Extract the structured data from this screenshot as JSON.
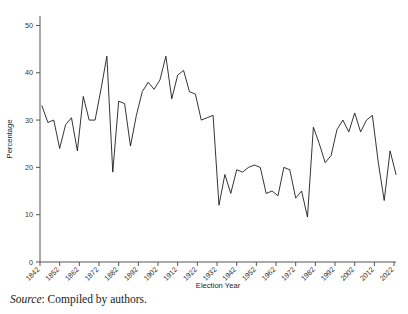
{
  "figure": {
    "source_note_label": "Source",
    "source_note_text": ": Compiled by authors."
  },
  "chart_data": {
    "type": "line",
    "title": "",
    "xlabel": "Election Year",
    "ylabel": "Percentage",
    "xlim": [
      1842,
      2023
    ],
    "ylim": [
      0,
      52
    ],
    "grid": false,
    "legend": "none",
    "line_color": "#111111",
    "axis_color": "#555555",
    "ytick_labels": [
      "0",
      "10",
      "20",
      "30",
      "40",
      "50"
    ],
    "ytick_values": [
      0,
      10,
      20,
      30,
      40,
      50
    ],
    "xtick_labels": [
      "1842",
      "1852",
      "1862",
      "1872",
      "1882",
      "1892",
      "1902",
      "1912",
      "1922",
      "1932",
      "1942",
      "1952",
      "1962",
      "1972",
      "1982",
      "1992",
      "2002",
      "2012",
      "2022"
    ],
    "xtick_values": [
      1842,
      1852,
      1862,
      1872,
      1882,
      1892,
      1902,
      1912,
      1922,
      1932,
      1942,
      1952,
      1962,
      1972,
      1982,
      1992,
      2002,
      2012,
      2022
    ],
    "series": [
      {
        "name": "Percentage",
        "x": [
          1843,
          1846,
          1849,
          1852,
          1855,
          1858,
          1861,
          1864,
          1867,
          1870,
          1873,
          1876,
          1879,
          1882,
          1885,
          1888,
          1891,
          1894,
          1897,
          1900,
          1903,
          1906,
          1909,
          1912,
          1915,
          1918,
          1921,
          1924,
          1927,
          1930,
          1933,
          1936,
          1939,
          1942,
          1945,
          1948,
          1951,
          1954,
          1957,
          1960,
          1963,
          1966,
          1969,
          1972,
          1975,
          1978,
          1981,
          1984,
          1987,
          1990,
          1993,
          1996,
          1999,
          2002,
          2005,
          2008,
          2011,
          2014,
          2017,
          2020,
          2023
        ],
        "y": [
          33.0,
          29.5,
          30.0,
          24.0,
          29.0,
          30.5,
          23.5,
          35.0,
          30.0,
          30.0,
          36.5,
          43.5,
          19.0,
          34.0,
          33.5,
          24.5,
          31.0,
          36.0,
          38.0,
          36.5,
          38.5,
          43.5,
          34.5,
          39.5,
          40.5,
          36.0,
          35.5,
          30.0,
          30.5,
          31.0,
          12.0,
          18.5,
          14.5,
          19.5,
          19.0,
          20.0,
          20.5,
          20.0,
          14.5,
          15.0,
          14.0,
          20.0,
          19.5,
          13.5,
          15.0,
          9.5,
          28.5,
          25.0,
          21.0,
          22.5,
          28.0,
          30.0,
          27.5,
          31.5,
          27.5,
          30.0,
          31.0,
          21.0,
          13.0,
          23.5,
          18.5
        ]
      }
    ]
  }
}
